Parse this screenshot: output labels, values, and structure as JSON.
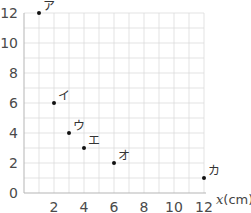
{
  "chart_data": {
    "type": "scatter",
    "title": "",
    "xlabel": "x(cm)",
    "ylabel": "",
    "xlim": [
      0,
      12
    ],
    "ylim": [
      0,
      12
    ],
    "grid": true,
    "x_ticks": [
      2,
      4,
      6,
      8,
      10,
      12
    ],
    "y_ticks": [
      0,
      2,
      4,
      6,
      8,
      10,
      12
    ],
    "points": [
      {
        "label": "ア",
        "x": 1,
        "y": 12
      },
      {
        "label": "イ",
        "x": 2,
        "y": 6
      },
      {
        "label": "ウ",
        "x": 3,
        "y": 4
      },
      {
        "label": "エ",
        "x": 4,
        "y": 3
      },
      {
        "label": "オ",
        "x": 6,
        "y": 2
      },
      {
        "label": "カ",
        "x": 12,
        "y": 1
      }
    ]
  },
  "axis": {
    "x_title_var": "x",
    "x_title_unit": "(cm)"
  },
  "colors": {
    "grid": "#dcdcdc",
    "axis": "#b5b5b5",
    "point": "#111111",
    "text": "#4a4a4a"
  }
}
